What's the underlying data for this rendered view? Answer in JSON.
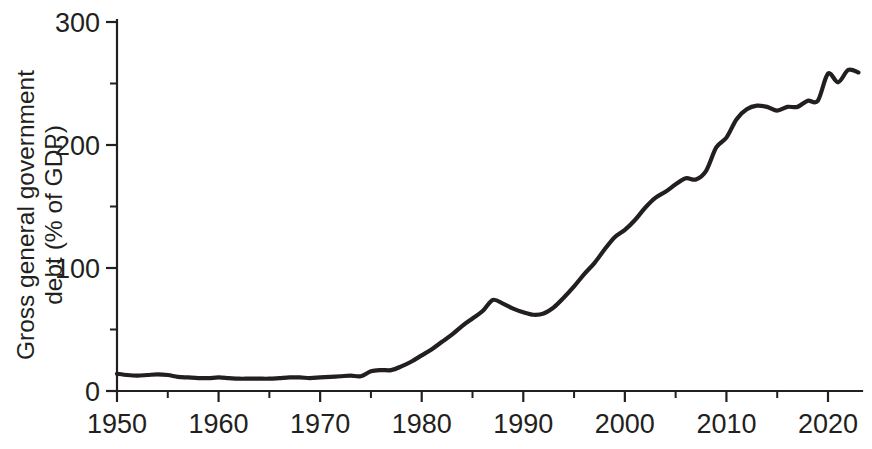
{
  "chart_data": {
    "type": "line",
    "title": "",
    "subtitle": "",
    "xlabel": "",
    "ylabel": "Gross general government debt (% of GDP)",
    "ylabel_line1": "Gross general government",
    "ylabel_line2": "debt (% of GDP)",
    "xlim": [
      1950,
      2023
    ],
    "ylim": [
      0,
      300
    ],
    "grid": false,
    "legend": "none",
    "x_ticks_major": [
      1950,
      1960,
      1970,
      1980,
      1990,
      2000,
      2010,
      2020
    ],
    "x_ticks_minor": [
      1955,
      1965,
      1975,
      1985,
      1995,
      2005,
      2015
    ],
    "x_tick_labels": [
      "1950",
      "1960",
      "1970",
      "1980",
      "1990",
      "2000",
      "2010",
      "2020"
    ],
    "y_ticks_major": [
      0,
      100,
      200,
      300
    ],
    "y_ticks_minor": [
      50,
      150,
      250
    ],
    "y_tick_labels": [
      "0",
      "100",
      "200",
      "300"
    ],
    "line_color": "#231f20",
    "series": [
      {
        "name": "Gross general government debt (% of GDP)",
        "x": [
          1950,
          1951,
          1952,
          1953,
          1954,
          1955,
          1956,
          1957,
          1958,
          1959,
          1960,
          1961,
          1962,
          1963,
          1964,
          1965,
          1966,
          1967,
          1968,
          1969,
          1970,
          1971,
          1972,
          1973,
          1974,
          1975,
          1976,
          1977,
          1978,
          1979,
          1980,
          1981,
          1982,
          1983,
          1984,
          1985,
          1986,
          1987,
          1988,
          1989,
          1990,
          1991,
          1992,
          1993,
          1994,
          1995,
          1996,
          1997,
          1998,
          1999,
          2000,
          2001,
          2002,
          2003,
          2004,
          2005,
          2006,
          2007,
          2008,
          2009,
          2010,
          2011,
          2012,
          2013,
          2014,
          2015,
          2016,
          2017,
          2018,
          2019,
          2020,
          2021,
          2022,
          2023
        ],
        "y": [
          14,
          13,
          12.5,
          13,
          13.5,
          13,
          11.5,
          11,
          10.5,
          10.5,
          11,
          10.5,
          10,
          10,
          10,
          10,
          10.5,
          11,
          11,
          10.5,
          11,
          11.5,
          12,
          12.5,
          12,
          16,
          17,
          17,
          20,
          24,
          29,
          34,
          40,
          46,
          53,
          59,
          65,
          74,
          71,
          67,
          64,
          62,
          63,
          68,
          76,
          85,
          95,
          104,
          115,
          125,
          131,
          139,
          149,
          157,
          162,
          168,
          173,
          172,
          179,
          198,
          206,
          221,
          229,
          232,
          231,
          228,
          231,
          231,
          236,
          236,
          258,
          251,
          261,
          259
        ]
      }
    ]
  },
  "axis": {
    "y_label_line1": "Gross general government",
    "y_label_line2": "debt (% of GDP)"
  }
}
